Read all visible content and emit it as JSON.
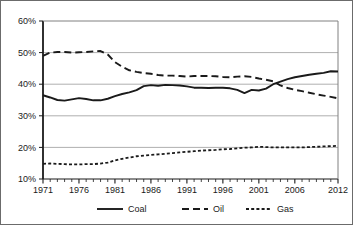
{
  "figure": {
    "background_color": "#ffffff",
    "border_color": "#6b6b6b"
  },
  "chart_data": {
    "type": "line",
    "title": "",
    "subtitle": "",
    "xlabel": "",
    "ylabel": "",
    "xlim": [
      1971,
      2012
    ],
    "ylim": [
      10,
      60
    ],
    "grid": "horizontal",
    "legend_position": "bottom-center",
    "y_ticks": [
      10,
      20,
      30,
      40,
      50,
      60
    ],
    "y_tick_labels": [
      "10%",
      "20%",
      "30%",
      "40%",
      "50%",
      "60%"
    ],
    "x_tick_labels": [
      "1971",
      "1976",
      "1981",
      "1986",
      "1991",
      "1996",
      "2001",
      "2006",
      "2012"
    ],
    "x_tick_values": [
      1971,
      1976,
      1981,
      1986,
      1991,
      1996,
      2001,
      2006,
      2012
    ],
    "x_minor_ticks_every": 1,
    "x": [
      1971,
      1972,
      1973,
      1974,
      1975,
      1976,
      1977,
      1978,
      1979,
      1980,
      1981,
      1982,
      1983,
      1984,
      1985,
      1986,
      1987,
      1988,
      1989,
      1990,
      1991,
      1992,
      1993,
      1994,
      1995,
      1996,
      1997,
      1998,
      1999,
      2000,
      2001,
      2002,
      2003,
      2004,
      2005,
      2006,
      2007,
      2008,
      2009,
      2010,
      2011,
      2012
    ],
    "series": [
      {
        "name": "Coal",
        "line_style": "solid",
        "color": "#1a1a1a",
        "values": [
          36.5,
          35.8,
          35.0,
          34.8,
          35.2,
          35.6,
          35.3,
          34.9,
          34.9,
          35.4,
          36.2,
          36.9,
          37.4,
          38.1,
          39.4,
          39.7,
          39.5,
          39.8,
          39.7,
          39.6,
          39.3,
          38.9,
          38.9,
          38.8,
          38.9,
          38.9,
          38.7,
          38.2,
          37.2,
          38.2,
          38.0,
          38.6,
          40.0,
          40.8,
          41.6,
          42.2,
          42.6,
          43.0,
          43.3,
          43.6,
          44.1,
          44.0
        ]
      },
      {
        "name": "Oil",
        "line_style": "dashed",
        "color": "#1a1a1a",
        "values": [
          49.0,
          50.0,
          50.2,
          50.2,
          50.0,
          50.1,
          50.2,
          50.4,
          50.5,
          49.4,
          47.0,
          45.5,
          44.4,
          43.9,
          43.5,
          43.3,
          42.9,
          42.7,
          42.7,
          42.6,
          42.4,
          42.6,
          42.6,
          42.6,
          42.5,
          42.3,
          42.2,
          42.4,
          42.5,
          42.3,
          41.8,
          41.4,
          40.9,
          39.6,
          38.8,
          38.2,
          37.8,
          37.3,
          36.8,
          36.4,
          36.0,
          35.5
        ]
      },
      {
        "name": "Gas",
        "line_style": "dotted",
        "color": "#1a1a1a",
        "values": [
          14.8,
          14.9,
          14.8,
          14.7,
          14.6,
          14.6,
          14.7,
          14.7,
          14.9,
          15.2,
          15.9,
          16.4,
          16.8,
          17.2,
          17.4,
          17.6,
          17.8,
          18.0,
          18.2,
          18.4,
          18.6,
          18.8,
          19.0,
          19.1,
          19.2,
          19.4,
          19.5,
          19.7,
          19.9,
          20.0,
          20.2,
          20.1,
          20.0,
          20.0,
          20.0,
          20.0,
          20.0,
          20.1,
          20.2,
          20.3,
          20.4,
          20.5
        ]
      }
    ],
    "legend": [
      {
        "label": "Coal",
        "line_style": "solid"
      },
      {
        "label": "Oil",
        "line_style": "dashed"
      },
      {
        "label": "Gas",
        "line_style": "dotted"
      }
    ]
  }
}
